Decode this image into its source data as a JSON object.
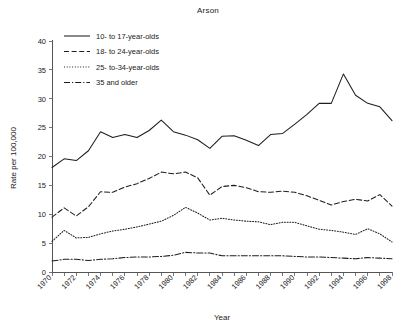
{
  "chart_data": {
    "type": "line",
    "title": "Arson",
    "xlabel": "Year",
    "ylabel": "Rate per 100,000",
    "xlim": [
      1970,
      1998
    ],
    "ylim": [
      0,
      40
    ],
    "yticks": [
      0,
      5,
      10,
      15,
      20,
      25,
      30,
      35,
      40
    ],
    "xticks": [
      1970,
      1972,
      1974,
      1976,
      1978,
      1980,
      1982,
      1984,
      1986,
      1988,
      1990,
      1992,
      1994,
      1996,
      1998
    ],
    "x": [
      1970,
      1971,
      1972,
      1973,
      1974,
      1975,
      1976,
      1977,
      1978,
      1979,
      1980,
      1981,
      1982,
      1983,
      1984,
      1985,
      1986,
      1987,
      1988,
      1989,
      1990,
      1991,
      1992,
      1993,
      1994,
      1995,
      1996,
      1997,
      1998
    ],
    "grid": false,
    "legend_position": "top-left",
    "series": [
      {
        "name": "10- to 17-year-olds",
        "style": "solid",
        "values": [
          18.1,
          19.6,
          19.3,
          21.0,
          24.3,
          23.3,
          23.8,
          23.3,
          24.5,
          26.3,
          24.3,
          23.7,
          22.9,
          21.4,
          23.5,
          23.6,
          22.8,
          21.9,
          23.8,
          24.0,
          25.6,
          27.3,
          29.2,
          29.2,
          34.3,
          30.6,
          29.2,
          28.6,
          26.2
        ]
      },
      {
        "name": "18- to 24-year-olds",
        "style": "dashed",
        "values": [
          9.5,
          11.1,
          9.7,
          11.3,
          13.9,
          13.8,
          14.7,
          15.3,
          16.2,
          17.3,
          17.0,
          17.3,
          16.3,
          13.3,
          14.8,
          15.0,
          14.6,
          13.9,
          13.8,
          14.0,
          13.8,
          13.2,
          12.4,
          11.6,
          12.2,
          12.6,
          12.3,
          13.4,
          11.4
        ]
      },
      {
        "name": "25- to-34-year-olds",
        "style": "dotted",
        "values": [
          5.3,
          7.2,
          5.9,
          6.0,
          6.6,
          7.1,
          7.4,
          7.8,
          8.3,
          8.8,
          9.8,
          11.2,
          10.2,
          9.0,
          9.3,
          9.0,
          8.8,
          8.7,
          8.2,
          8.6,
          8.6,
          8.0,
          7.4,
          7.2,
          6.9,
          6.5,
          7.5,
          6.6,
          5.2
        ]
      },
      {
        "name": "35 and older",
        "style": "dashdot",
        "values": [
          1.9,
          2.2,
          2.2,
          2.0,
          2.2,
          2.3,
          2.5,
          2.6,
          2.6,
          2.7,
          2.9,
          3.4,
          3.3,
          3.3,
          2.8,
          2.8,
          2.8,
          2.8,
          2.8,
          2.8,
          2.7,
          2.6,
          2.6,
          2.5,
          2.4,
          2.3,
          2.5,
          2.4,
          2.3
        ]
      }
    ]
  },
  "legend": {
    "items": [
      {
        "label": "10- to 17-year-olds"
      },
      {
        "label": "18- to 24-year-olds"
      },
      {
        "label": "25- to-34-year-olds"
      },
      {
        "label": "35 and older"
      }
    ]
  },
  "colors": {
    "line": "#1e1e1e",
    "axis": "#555555",
    "text": "#222222",
    "background": "#ffffff"
  }
}
